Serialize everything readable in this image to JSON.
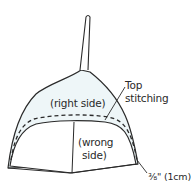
{
  "diagram": {
    "colors": {
      "stroke": "#2a2a2a",
      "right_side_fill": "#eef6f8",
      "wrong_side_fill": "#ffffff",
      "background": "#ffffff"
    },
    "labels": {
      "right_side": "(right side)",
      "wrong_side_line1": "(wrong",
      "wrong_side_line2": "side)",
      "top_stitching_line1": "Top",
      "top_stitching_line2": "stitching",
      "seam_allowance": "⅜\" (1cm)"
    }
  }
}
